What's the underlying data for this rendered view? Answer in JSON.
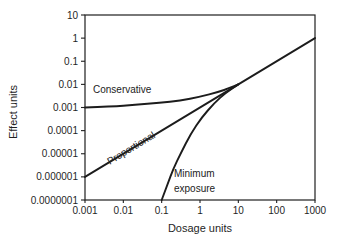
{
  "figure": {
    "background_color": "#ffffff",
    "line_color": "#1c1c1c",
    "text_color": "#1f1f1f"
  },
  "chart_data": {
    "type": "line",
    "scale": "log-log",
    "grid": false,
    "legend": "none (curves labeled directly on plot)",
    "title": "",
    "xlabel": "Dosage units",
    "ylabel": "Effect units",
    "x_axis": {
      "label": "Dosage units",
      "scale": "log",
      "range": [
        0.001,
        1000
      ],
      "ticks": [
        "0.001",
        "0.01",
        "0.1",
        "1",
        "10",
        "100",
        "1000"
      ]
    },
    "y_axis": {
      "label": "Effect units",
      "scale": "log",
      "range": [
        1e-07,
        10
      ],
      "ticks": [
        "10",
        "1",
        "0.1",
        "0.01",
        "0.001",
        "0.0001",
        "0.00001",
        "0.000001",
        "0.0000001"
      ]
    },
    "series": [
      {
        "id": "conservative",
        "name": "Conservative",
        "description": "starts at background effect 0.001 at dose 0.001, rises slowly, merges with others at (10, 0.01)",
        "points": [
          [
            0.001,
            0.001
          ],
          [
            0.005,
            0.0011
          ],
          [
            0.02,
            0.0013
          ],
          [
            0.09,
            0.0016
          ],
          [
            0.3,
            0.002
          ],
          [
            1,
            0.0029
          ],
          [
            3,
            0.0047
          ],
          [
            6,
            0.007
          ],
          [
            10,
            0.01
          ]
        ]
      },
      {
        "id": "proportional",
        "name": "Proportional",
        "description": "straight line of slope 1 on log-log axes from (0.001, 0.000001) through (10, 0.01) to (1000, 1)",
        "points": [
          [
            0.001,
            1e-06
          ],
          [
            1000,
            1
          ]
        ]
      },
      {
        "id": "minimum-exposure",
        "name": "Minimum exposure",
        "description": "threshold curve rising steeply from dose ~0.1 at the bottom axis, merging with others at (10, 0.01)",
        "points": [
          [
            0.1,
            1e-07
          ],
          [
            0.14,
            4.5e-07
          ],
          [
            0.2,
            2.2e-06
          ],
          [
            0.32,
            1.1e-05
          ],
          [
            0.58,
            7.4e-05
          ],
          [
            1.1,
            0.00037
          ],
          [
            2.3,
            0.0015
          ],
          [
            4.8,
            0.0045
          ],
          [
            10,
            0.01
          ]
        ]
      }
    ],
    "annotations": [
      {
        "text": "Conservative",
        "near": [
          0.01,
          0.0067
        ],
        "rotation": 0
      },
      {
        "text": "Proportional",
        "near": [
          0.016,
          1.65e-05
        ],
        "rotation": -31
      },
      {
        "text": "Minimum exposure",
        "near": [
          0.9,
          6e-07
        ],
        "rotation": 0
      }
    ],
    "convergence_point": [
      10,
      0.01
    ]
  }
}
